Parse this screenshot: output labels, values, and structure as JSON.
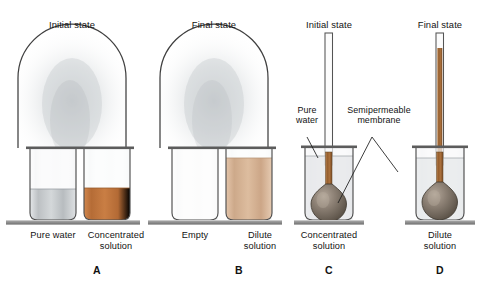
{
  "figure": {
    "title_hidden": "Osmosis: bell jar vapor transfer and osmometer experiments",
    "background": "#ffffff"
  },
  "colors": {
    "concentrated_solution": "#c1763f",
    "dilute_solution": "#d8b394",
    "pure_water": "#c9ccce",
    "glass_outline": "#4a4a4a",
    "shelf": "#8e8e8e",
    "bulb_membrane": "#8a7f74",
    "tube_liquid": "#a9703f",
    "text": "#121212"
  },
  "panels": [
    {
      "id": "A",
      "letter": "A",
      "state_label": "Initial state",
      "type": "bell-jar",
      "beakers": [
        {
          "label": "Pure water",
          "fill": "pure-water",
          "fill_level": 0.33
        },
        {
          "label": "Concentrated\nsolution",
          "fill": "concentrated",
          "fill_level": 0.33
        }
      ]
    },
    {
      "id": "B",
      "letter": "B",
      "state_label": "Final state",
      "type": "bell-jar",
      "beakers": [
        {
          "label": "Empty",
          "fill": "none",
          "fill_level": 0.0
        },
        {
          "label": "Dilute\nsolution",
          "fill": "dilute",
          "fill_level": 0.74
        }
      ]
    },
    {
      "id": "C",
      "letter": "C",
      "state_label": "Initial state",
      "type": "osmometer",
      "beaker_label": "Concentrated\nsolution",
      "tube_liquid_height": 0.05,
      "callouts": [
        {
          "text": "Pure\nwater",
          "target": "beaker-liquid"
        },
        {
          "text": "Semipermeable\nmembrane",
          "target": "bulb"
        }
      ]
    },
    {
      "id": "D",
      "letter": "D",
      "state_label": "Final state",
      "type": "osmometer",
      "beaker_label": "Dilute\nsolution",
      "tube_liquid_height": 0.8,
      "callouts": []
    }
  ],
  "labels": {
    "initial_state": "Initial state",
    "final_state": "Final state",
    "pure_water": "Pure water",
    "concentrated_solution": "Concentrated\nsolution",
    "empty": "Empty",
    "dilute_solution": "Dilute\nsolution",
    "callout_pure_water": "Pure\nwater",
    "callout_membrane": "Semipermeable\nmembrane",
    "panel_a": "A",
    "panel_b": "B",
    "panel_c": "C",
    "panel_d": "D"
  }
}
